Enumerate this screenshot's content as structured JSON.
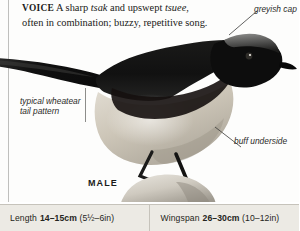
{
  "voice": {
    "heading": "VOICE",
    "text_1": " A sharp ",
    "call_1": "tsak",
    "text_2": " and upswept ",
    "call_2": "tsuee",
    "text_3": ", often in combination; buzzy, repetitive song."
  },
  "annotations": {
    "cap": "greyish cap",
    "tail": "typical wheatear tail pattern",
    "underside": "buff underside"
  },
  "caption": {
    "sex": "MALE"
  },
  "measurements": [
    {
      "label": "Length",
      "metric": "14–15cm",
      "imperial": "(5½–6in)"
    },
    {
      "label": "Wingspan",
      "metric": "26–30cm",
      "imperial": "(10–12in)"
    }
  ],
  "colors": {
    "page_background": "#fdfdfc",
    "bar_background": "#eceae4",
    "bar_border": "#c6c3bb",
    "rule": "#bfbfbd",
    "text": "#1a1a18",
    "bird_upper": "#141414",
    "bird_underside": "#c9c2b4",
    "bird_cap": "#6f6f6d",
    "rock": "#d8d4cb"
  },
  "illustration": {
    "subject": "male wheatear perched on a stone",
    "icon": "bird-illustration"
  }
}
